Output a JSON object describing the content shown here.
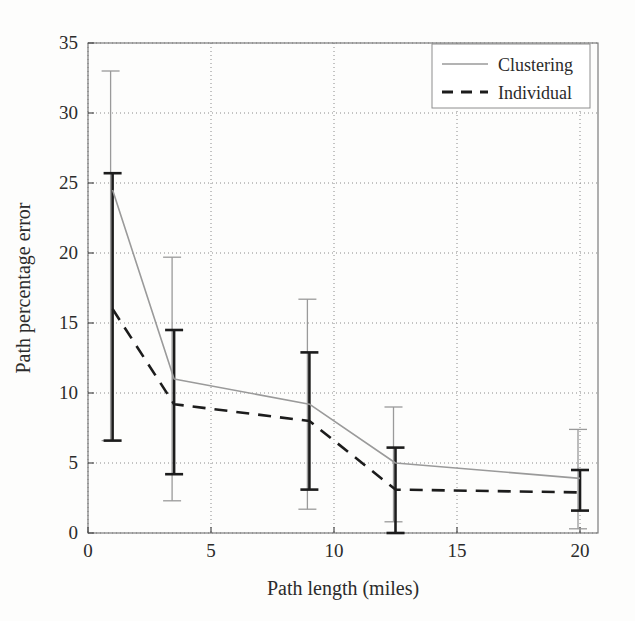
{
  "chart_data": {
    "type": "line",
    "title": "",
    "xlabel": "Path length (miles)",
    "ylabel": "Path percentage error",
    "xlim": [
      0,
      20
    ],
    "ylim": [
      0,
      35
    ],
    "xticks": [
      0,
      5,
      10,
      15,
      20
    ],
    "yticks": [
      0,
      5,
      10,
      15,
      20,
      25,
      30,
      35
    ],
    "xtick_labels": [
      "0",
      "5",
      "10",
      "15",
      "20"
    ],
    "ytick_labels": [
      "0",
      "5",
      "10",
      "15",
      "20",
      "25",
      "30",
      "35"
    ],
    "grid": true,
    "grid_style": "dotted",
    "legend_position": "upper right",
    "error_bars": true,
    "x": [
      1,
      3.5,
      9,
      12.5,
      20
    ],
    "series": [
      {
        "name": "Clustering",
        "color": "#9a9a9a",
        "linestyle": "solid",
        "values": [
          24.5,
          11.0,
          9.2,
          5.0,
          3.9
        ],
        "err_low": [
          6.6,
          2.3,
          1.7,
          0.8,
          0.3
        ],
        "err_high": [
          33.0,
          19.7,
          16.7,
          9.0,
          7.4
        ]
      },
      {
        "name": "Individual",
        "color": "#1c1c1c",
        "linestyle": "dashed",
        "values": [
          16.0,
          9.2,
          8.0,
          3.1,
          2.9
        ],
        "err_low": [
          6.6,
          4.2,
          3.1,
          0.0,
          1.6
        ],
        "err_high": [
          25.7,
          14.5,
          12.9,
          6.1,
          4.5
        ]
      }
    ]
  },
  "legend": {
    "entries": [
      {
        "label": "Clustering"
      },
      {
        "label": "Individual"
      }
    ]
  },
  "axes": {
    "x_title": "Path length (miles)",
    "y_title": "Path percentage error"
  }
}
